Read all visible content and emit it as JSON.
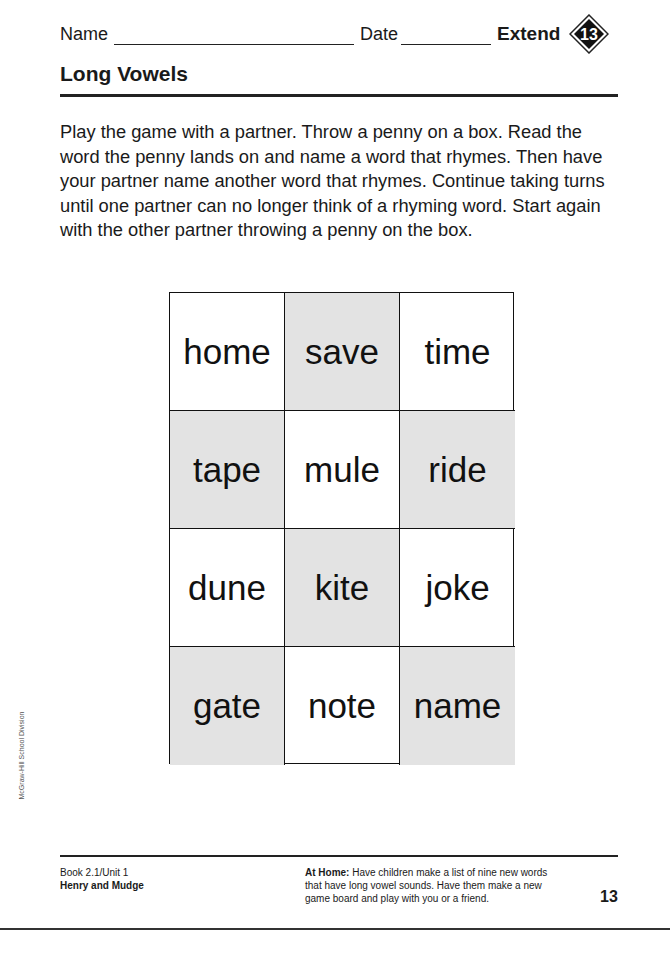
{
  "header": {
    "name_label": "Name",
    "date_label": "Date",
    "extend_label": "Extend",
    "badge_number": "13"
  },
  "title": "Long Vowels",
  "instructions": "Play the game with a partner. Throw a penny on a box. Read the word the penny lands on and name a word that rhymes. Then have your partner name another word that rhymes. Continue taking turns until one partner can no longer think of a rhyming word. Start again with the other partner throwing a penny on the box.",
  "game_board": {
    "colors": {
      "shaded": "#e3e3e3",
      "plain": "#ffffff"
    },
    "cells": [
      {
        "word": "home",
        "shaded": false
      },
      {
        "word": "save",
        "shaded": true
      },
      {
        "word": "time",
        "shaded": false
      },
      {
        "word": "tape",
        "shaded": true
      },
      {
        "word": "mule",
        "shaded": false
      },
      {
        "word": "ride",
        "shaded": true
      },
      {
        "word": "dune",
        "shaded": false
      },
      {
        "word": "kite",
        "shaded": true
      },
      {
        "word": "joke",
        "shaded": false
      },
      {
        "word": "gate",
        "shaded": true
      },
      {
        "word": "note",
        "shaded": false
      },
      {
        "word": "name",
        "shaded": true
      }
    ]
  },
  "side_credit": "McGraw-Hill School Division",
  "footer": {
    "book": "Book 2.1/Unit 1",
    "story": "Henry and Mudge",
    "at_home_label": "At Home:",
    "at_home_text": "Have children make a list of nine new words that have long vowel sounds. Have them make a new game board and play with you or a friend.",
    "page_number": "13"
  }
}
